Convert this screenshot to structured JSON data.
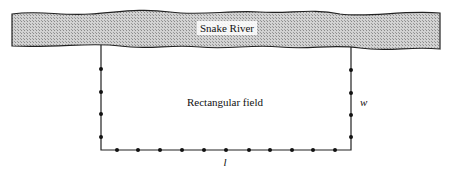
{
  "diagram": {
    "river_label": "Snake River",
    "field_label": "Rectangular field",
    "width_label": "w",
    "length_label": "l",
    "colors": {
      "river_fill": "#bdbdbd",
      "line": "#222222",
      "post": "#111111"
    },
    "field": {
      "left": 101,
      "right": 351,
      "bottom": 150,
      "top": 45
    },
    "left_posts_y": [
      69,
      92,
      114,
      137
    ],
    "right_posts_y": [
      70,
      93,
      115,
      137
    ],
    "bottom_posts_x": [
      117,
      138,
      160,
      182,
      204,
      226,
      249,
      270,
      292,
      313,
      335
    ]
  }
}
